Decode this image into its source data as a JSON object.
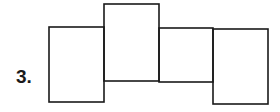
{
  "problem": {
    "number_label": "3."
  },
  "diagram": {
    "stroke_color": "#1a1a1a",
    "stroke_width": 1.6,
    "rectangles": [
      {
        "id": "rect-1",
        "x": 49,
        "y": 27,
        "w": 55,
        "h": 75
      },
      {
        "id": "rect-2",
        "x": 104,
        "y": 4,
        "w": 55,
        "h": 77
      },
      {
        "id": "rect-3",
        "x": 159,
        "y": 28,
        "w": 54,
        "h": 54
      },
      {
        "id": "rect-4",
        "x": 213,
        "y": 29,
        "w": 55,
        "h": 75
      }
    ]
  }
}
